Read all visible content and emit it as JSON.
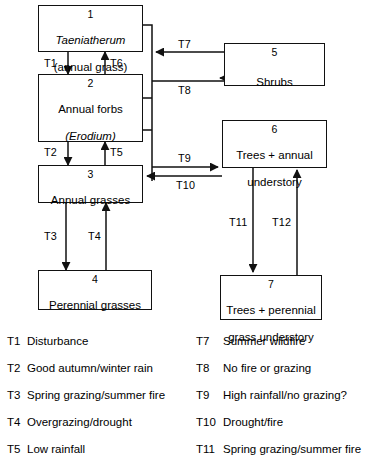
{
  "diagram": {
    "type": "state-and-transition-diagram",
    "nodes": [
      {
        "id": "node-1",
        "number": "1",
        "label_line1": "Taeniatherum",
        "label_line1_italic": true,
        "label_line2": "(annual grass)"
      },
      {
        "id": "node-2",
        "number": "2",
        "label_line1": "Annual forbs",
        "label_line1_italic": false,
        "label_line2": "(Erodium)",
        "label_line2_italic": true
      },
      {
        "id": "node-3",
        "number": "3",
        "label_line1": "Annual grasses",
        "label_line1_italic": false,
        "label_line2": ""
      },
      {
        "id": "node-4",
        "number": "4",
        "label_line1": "Perennial grasses",
        "label_line1_italic": false,
        "label_line2": ""
      },
      {
        "id": "node-5",
        "number": "5",
        "label_line1": "Shrubs",
        "label_line1_italic": false,
        "label_line2": ""
      },
      {
        "id": "node-6",
        "number": "6",
        "label_line1": "Trees + annual",
        "label_line1_italic": false,
        "label_line2": "understory"
      },
      {
        "id": "node-7",
        "number": "7",
        "label_line1": "Trees + perennial",
        "label_line1_italic": false,
        "label_line2": "grass understory"
      }
    ],
    "edges": [
      {
        "id": "edge-t1",
        "code": "T1",
        "from": "node-1",
        "to": "node-2",
        "direction": "down"
      },
      {
        "id": "edge-t2",
        "code": "T2",
        "from": "node-2",
        "to": "node-3",
        "direction": "down"
      },
      {
        "id": "edge-t3",
        "code": "T3",
        "from": "node-3",
        "to": "node-4",
        "direction": "down"
      },
      {
        "id": "edge-t4",
        "code": "T4",
        "from": "node-4",
        "to": "node-3",
        "direction": "up"
      },
      {
        "id": "edge-t5",
        "code": "T5",
        "from": "node-3",
        "to": "node-2",
        "direction": "up"
      },
      {
        "id": "edge-t6",
        "code": "T6",
        "from": "node-2",
        "to": "node-1",
        "direction": "up"
      },
      {
        "id": "edge-t7",
        "code": "T7",
        "from": "node-5",
        "to": "node-1",
        "direction": "left"
      },
      {
        "id": "edge-t8",
        "code": "T8",
        "from": "node-2",
        "to": "node-5",
        "direction": "right"
      },
      {
        "id": "edge-t9",
        "code": "T9",
        "from": "node-3",
        "to": "node-6",
        "direction": "right"
      },
      {
        "id": "edge-t10",
        "code": "T10",
        "from": "node-6",
        "to": "node-3",
        "direction": "left"
      },
      {
        "id": "edge-t11",
        "code": "T11",
        "from": "node-6",
        "to": "node-7",
        "direction": "down"
      },
      {
        "id": "edge-t12",
        "code": "T12",
        "from": "node-7",
        "to": "node-6",
        "direction": "up"
      }
    ]
  },
  "legend": {
    "left_column": [
      {
        "code": "T1",
        "description": "Disturbance"
      },
      {
        "code": "T2",
        "description": "Good autumn/winter rain"
      },
      {
        "code": "T3",
        "description": "Spring grazing/summer fire"
      },
      {
        "code": "T4",
        "description": "Overgrazing/drought"
      },
      {
        "code": "T5",
        "description": "Low rainfall"
      }
    ],
    "right_column": [
      {
        "code": "T7",
        "description": "Summer wildfire"
      },
      {
        "code": "T8",
        "description": "No fire or grazing"
      },
      {
        "code": "T9",
        "description": "High rainfall/no grazing?"
      },
      {
        "code": "T10",
        "description": "Drought/fire"
      },
      {
        "code": "T11",
        "description": "Spring grazing/summer fire"
      }
    ]
  },
  "colors": {
    "line": "#111111",
    "background": "#ffffff",
    "text": "#000000"
  }
}
